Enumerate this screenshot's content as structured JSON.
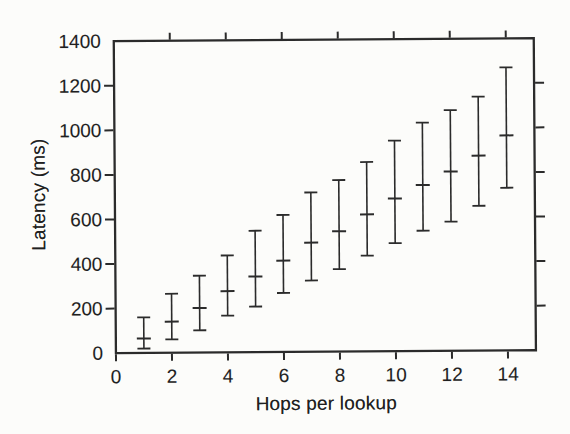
{
  "figure": {
    "title": "",
    "xlabel": "Hops per lookup",
    "ylabel": "Latency (ms)"
  },
  "chart_data": {
    "type": "scatter",
    "subtype": "yerrorbar",
    "title": "",
    "xlabel": "Hops per lookup",
    "ylabel": "Latency (ms)",
    "xlim": [
      0,
      15
    ],
    "ylim": [
      0,
      1400
    ],
    "xticks": [
      0,
      2,
      4,
      6,
      8,
      10,
      12,
      14
    ],
    "yticks": [
      0,
      200,
      400,
      600,
      800,
      1000,
      1200,
      1400
    ],
    "grid": false,
    "legend": "none",
    "series": [
      {
        "name": "lookup latency per hop count",
        "x": [
          1,
          2,
          3,
          4,
          5,
          6,
          7,
          8,
          9,
          10,
          11,
          12,
          13,
          14
        ],
        "mean": [
          65,
          140,
          200,
          275,
          340,
          410,
          490,
          540,
          615,
          685,
          745,
          805,
          875,
          965
        ],
        "low": [
          20,
          60,
          100,
          165,
          205,
          265,
          320,
          370,
          430,
          485,
          540,
          580,
          650,
          730
        ],
        "high": [
          160,
          265,
          345,
          435,
          545,
          615,
          715,
          770,
          850,
          945,
          1025,
          1080,
          1140,
          1270
        ]
      }
    ],
    "colors": {
      "ink": "#2b2b2b",
      "text": "#1f1f1f",
      "background": "#fcfcfa"
    }
  }
}
